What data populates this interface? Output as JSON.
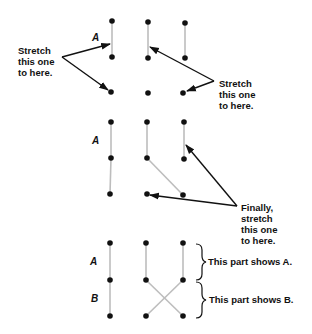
{
  "panels": [
    {
      "id": "panel-1",
      "row_label": "A",
      "annotations": {
        "left": [
          "Stretch",
          "this one",
          "to here."
        ],
        "right": [
          "Stretch",
          "this one",
          "to here."
        ]
      }
    },
    {
      "id": "panel-2",
      "row_label": "A",
      "annotations": {
        "right": [
          "Finally,",
          "stretch",
          "this one",
          "to here."
        ]
      }
    },
    {
      "id": "panel-3",
      "row_labels": [
        "A",
        "B"
      ],
      "brace_labels": {
        "top": "This part shows A.",
        "bottom": "This part shows B."
      }
    }
  ],
  "colors": {
    "dot": "#111111",
    "line": "#bdbdbd",
    "arrow": "#111111"
  }
}
